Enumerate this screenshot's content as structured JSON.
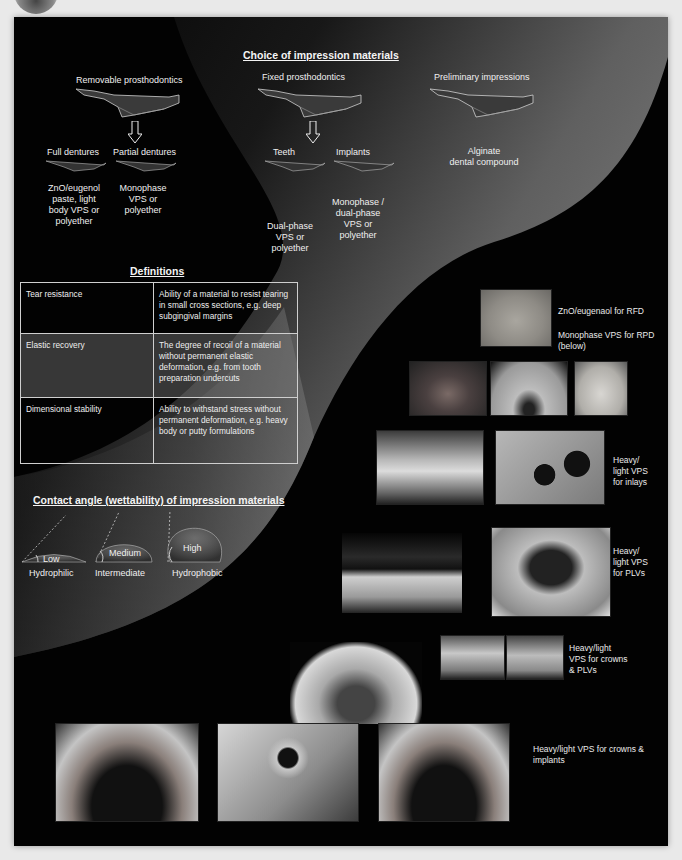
{
  "choice": {
    "title": "Choice of impression materials",
    "categories": [
      {
        "label": "Removable prosthodontics"
      },
      {
        "label": "Fixed prosthodontics"
      },
      {
        "label": "Preliminary impressions",
        "materials": [
          "Alginate",
          "dental compound"
        ]
      }
    ],
    "removable": [
      {
        "label": "Full dentures",
        "materials": [
          "ZnO/eugenol",
          "paste, light",
          "body VPS or",
          "polyether"
        ]
      },
      {
        "label": "Partial dentures",
        "materials": [
          "Monophase",
          "VPS or",
          "polyether"
        ]
      }
    ],
    "fixed": [
      {
        "label": "Teeth",
        "materials": [
          "Dual-phase",
          "VPS or",
          "polyether"
        ]
      },
      {
        "label": "Implants",
        "materials": [
          "Monophase /",
          "dual-phase",
          "VPS or",
          "polyether"
        ]
      }
    ]
  },
  "definitions": {
    "title": "Definitions",
    "rows": [
      {
        "term": "Tear resistance",
        "definition": "Ability of a material to resist tearing in small cross sections, e.g. deep subgingival margins"
      },
      {
        "term": "Elastic recovery",
        "definition": "The degree of recoil of a material without permanent elastic deformation, e.g. from tooth preparation undercuts"
      },
      {
        "term": "Dimensional stability",
        "definition": "Ability to withstand stress without permanent deformation, e.g. heavy body or putty formulations"
      }
    ]
  },
  "contact_angle": {
    "title": "Contact angle  (wettability) of impression materials",
    "drops": [
      {
        "angle": "Low",
        "label": "Hydrophilic"
      },
      {
        "angle": "Medium",
        "label": "Intermediate"
      },
      {
        "angle": "High",
        "label": "Hydrophobic"
      }
    ]
  },
  "photos": {
    "captions": {
      "rfd": "ZnO/eugenaol for RFD",
      "rpd": [
        "Monophase VPS for RPD",
        "(below)"
      ],
      "inlays": [
        "Heavy/",
        "light VPS",
        "for inlays"
      ],
      "plvs": [
        "Heavy/",
        "light VPS",
        "for PLVs"
      ],
      "crowns_plvs": [
        "Heavy/light",
        "VPS for crowns",
        "& PLVs"
      ],
      "crowns_implants": [
        "Heavy/light VPS for crowns &",
        "implants"
      ]
    }
  }
}
